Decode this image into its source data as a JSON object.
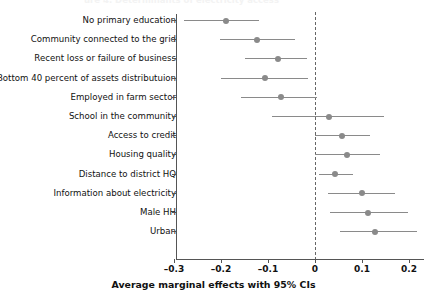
{
  "figure": {
    "clipped_top_title": "ure 4. Determinants of electricity access",
    "background": "#ffffff",
    "point_color": "#8a8a8a",
    "line_color": "#8a8a8a",
    "axis_color": "#555555",
    "zero_line_color": "#666666"
  },
  "chart_data": {
    "type": "scatter",
    "title": "",
    "xlabel": "Average marginal effects with 95% CIs",
    "ylabel": "",
    "xlim": [
      -0.32,
      0.235
    ],
    "grid": false,
    "legend": null,
    "reference_line": 0,
    "xticks": [
      -0.3,
      -0.2,
      -0.1,
      0,
      0.1,
      0.2
    ],
    "xtick_labels": [
      "–0.3",
      "–0.2",
      "–0.1",
      "0",
      "0.1",
      "0.2"
    ],
    "categories": [
      "No primary education",
      "Community connected to the grid",
      "Recent loss or failure of business",
      "Bottom 40 percent of assets distributuion",
      "Employed in farm sector",
      "School in the community",
      "Access to credit",
      "Housing quality",
      "Distance to district HQ",
      "Information about electricity",
      "Male HH",
      "Urban"
    ],
    "values": [
      -0.19,
      -0.123,
      -0.079,
      -0.107,
      -0.072,
      0.03,
      0.057,
      0.068,
      0.043,
      0.1,
      0.113,
      0.128
    ],
    "ci_low": [
      -0.279,
      -0.202,
      -0.149,
      -0.2,
      -0.157,
      -0.091,
      0.0,
      0.0,
      0.008,
      0.028,
      0.032,
      0.053
    ],
    "ci_high": [
      -0.119,
      -0.043,
      -0.017,
      -0.015,
      0.004,
      0.147,
      0.117,
      0.138,
      0.081,
      0.17,
      0.198,
      0.217
    ]
  }
}
